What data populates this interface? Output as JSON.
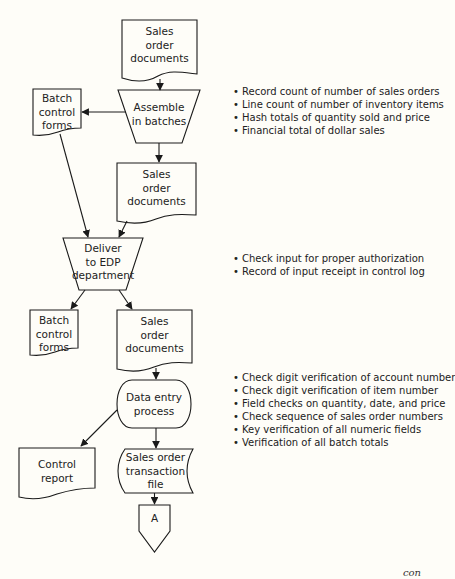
{
  "diagram": {
    "nodes": {
      "sales_docs_1": {
        "label": "Sales order documents",
        "lines": [
          "Sales",
          "order",
          "documents"
        ],
        "shape": "document"
      },
      "assemble": {
        "label": "Assemble in batches",
        "lines": [
          "Assemble",
          "in batches"
        ],
        "shape": "manual-operation"
      },
      "batch_forms_1": {
        "label": "Batch control forms",
        "lines": [
          "Batch",
          "control",
          "forms"
        ],
        "shape": "document"
      },
      "sales_docs_2": {
        "label": "Sales order documents",
        "lines": [
          "Sales",
          "order",
          "documents"
        ],
        "shape": "document"
      },
      "deliver": {
        "label": "Deliver to EDP department",
        "lines": [
          "Deliver",
          "to EDP",
          "department"
        ],
        "shape": "manual-operation"
      },
      "batch_forms_2": {
        "label": "Batch control forms",
        "lines": [
          "Batch",
          "control",
          "forms"
        ],
        "shape": "document"
      },
      "sales_docs_3": {
        "label": "Sales order documents",
        "lines": [
          "Sales",
          "order",
          "documents"
        ],
        "shape": "document"
      },
      "data_entry": {
        "label": "Data entry process",
        "lines": [
          "Data entry",
          "process"
        ],
        "shape": "terminal"
      },
      "control_report": {
        "label": "Control report",
        "lines": [
          "Control",
          "report"
        ],
        "shape": "document"
      },
      "transaction_file": {
        "label": "Sales order transaction file",
        "lines": [
          "Sales order",
          "transaction",
          "file"
        ],
        "shape": "stored-data"
      },
      "connector_a": {
        "label": "A",
        "shape": "off-page-connector"
      }
    },
    "edges": [
      {
        "from": "sales_docs_1",
        "to": "assemble"
      },
      {
        "from": "assemble",
        "to": "batch_forms_1"
      },
      {
        "from": "assemble",
        "to": "sales_docs_2"
      },
      {
        "from": "batch_forms_1",
        "to": "deliver"
      },
      {
        "from": "sales_docs_2",
        "to": "deliver"
      },
      {
        "from": "deliver",
        "to": "batch_forms_2"
      },
      {
        "from": "deliver",
        "to": "sales_docs_3"
      },
      {
        "from": "sales_docs_3",
        "to": "data_entry"
      },
      {
        "from": "data_entry",
        "to": "control_report"
      },
      {
        "from": "data_entry",
        "to": "transaction_file"
      },
      {
        "from": "transaction_file",
        "to": "connector_a"
      }
    ],
    "annotations": {
      "assemble_controls": [
        "Record count of number of sales orders",
        "Line count of number of inventory items",
        "Hash totals of quantity sold and price",
        "Financial total of dollar sales"
      ],
      "deliver_controls": [
        "Check input for proper authorization",
        "Record of input receipt in control log"
      ],
      "data_entry_controls": [
        "Check digit verification of account number",
        "Check digit verification of item number",
        "Field checks on quantity, date, and price",
        "Check sequence of sales order numbers",
        "Key verification of all numeric fields",
        "Verification of all batch totals"
      ]
    },
    "continued_text": "con"
  },
  "colors": {
    "background": "#fefdf8",
    "stroke": "#1a1a1a"
  }
}
